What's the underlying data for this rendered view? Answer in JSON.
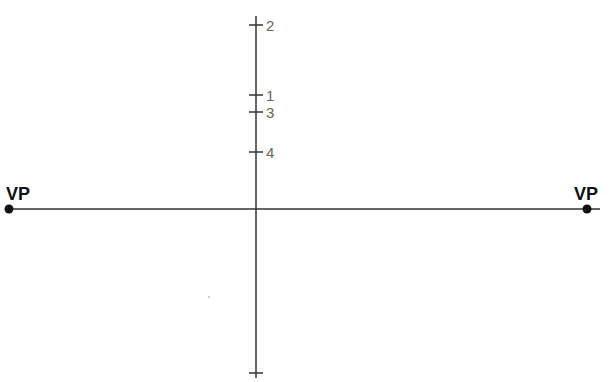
{
  "diagram": {
    "horizon_line": {
      "y": 209
    },
    "vertical_line": {
      "x": 256,
      "top": 16,
      "bottom": 376
    },
    "vanishing_points": [
      {
        "label": "VP",
        "x": 9,
        "y": 209
      },
      {
        "label": "VP",
        "x": 587,
        "y": 209
      }
    ],
    "ticks": [
      {
        "label": "2",
        "y": 25
      },
      {
        "label": "1",
        "y": 95
      },
      {
        "label": "3",
        "y": 112
      },
      {
        "label": "4",
        "y": 152
      },
      {
        "label": "",
        "y": 373
      }
    ],
    "colors": {
      "line": "#333333",
      "label": "#666666",
      "vp": "#111111"
    }
  }
}
